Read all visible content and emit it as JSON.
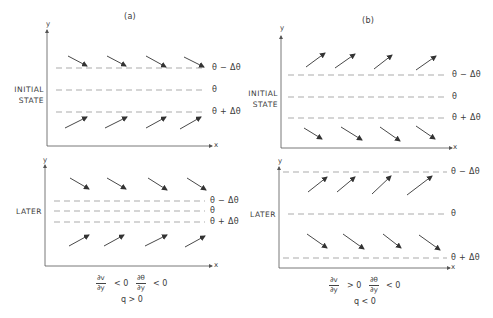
{
  "figure": {
    "panels": [
      {
        "id": "a",
        "title": "(a)",
        "initial": {
          "state_label_line1": "INITIAL",
          "state_label_line2": "STATE",
          "levels": [
            "θ − Δθ",
            "θ",
            "θ + Δθ"
          ],
          "upper_arrows": "down-right",
          "lower_arrows": "up-right"
        },
        "later": {
          "state_label": "LATER",
          "levels": [
            "θ − Δθ",
            "θ",
            "θ + Δθ"
          ],
          "upper_arrows": "down-right",
          "lower_arrows": "up-right"
        },
        "condition": {
          "dv_num": "∂v",
          "dv_den": "∂y",
          "dv_rel": "< 0",
          "dth_num": "∂θ",
          "dth_den": "∂y",
          "dth_rel": "< 0",
          "q_rel": "q > 0"
        }
      },
      {
        "id": "b",
        "title": "(b)",
        "initial": {
          "state_label_line1": "INITIAL",
          "state_label_line2": "STATE",
          "levels": [
            "θ − Δθ",
            "θ",
            "θ + Δθ"
          ],
          "upper_arrows": "up-right",
          "lower_arrows": "down-right"
        },
        "later": {
          "state_label": "LATER",
          "levels": [
            "θ − Δθ",
            "θ",
            "θ + Δθ"
          ],
          "upper_arrows": "up-right",
          "lower_arrows": "down-right"
        },
        "condition": {
          "dv_num": "∂v",
          "dv_den": "∂y",
          "dv_rel": "> 0",
          "dth_num": "∂θ",
          "dth_den": "∂y",
          "dth_rel": "< 0",
          "q_rel": "q < 0"
        }
      }
    ],
    "axis_labels": {
      "x": "x",
      "y": "y"
    }
  }
}
